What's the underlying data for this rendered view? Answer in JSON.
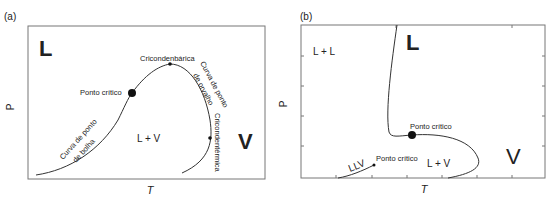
{
  "panel_a": {
    "tag": "(a)",
    "x_label": "T",
    "y_label": "P",
    "regions": {
      "liquid": "L",
      "vapor": "V",
      "two_phase": "L + V"
    },
    "annotations": {
      "critical_point": "Ponto crítico",
      "cricondenbar": "Cricondenbárica",
      "cricondentherm": "Cricondentérmica",
      "bubble_curve_1": "Curva de ponto",
      "bubble_curve_2": "de bolha",
      "dew_curve_1": "Curva de ponto",
      "dew_curve_2": "de orvalho"
    }
  },
  "panel_b": {
    "tag": "(b)",
    "x_label": "T",
    "y_label": "P",
    "regions": {
      "liquid": "L",
      "vapor": "V",
      "two_phase": "L + V",
      "liquid_liquid": "L + L",
      "llv": "LLV"
    },
    "annotations": {
      "critical_point_upper": "Ponto crítico",
      "critical_point_lower": "Ponto crítico"
    }
  },
  "colors": {
    "line": "#333333",
    "frame": "#777777",
    "text": "#222222"
  }
}
